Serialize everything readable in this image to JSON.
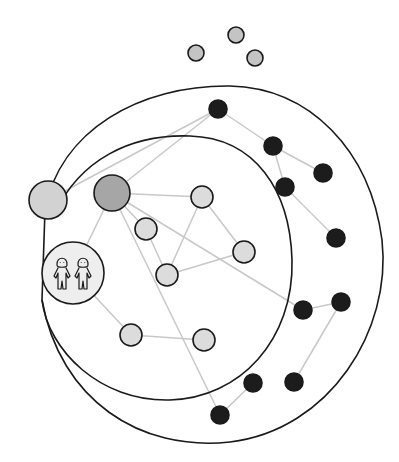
{
  "diagram": {
    "title": "",
    "colors": {
      "background": "#ffffff",
      "boundary": "#1a1a1a",
      "edge": "#c8c8c8",
      "node_stroke": "#1a1a1a",
      "outside_node": "#c4c4c4",
      "large_node": "#d2d2d2",
      "hub_node": "#a6a6a6",
      "inner_node": "#dcdcdc",
      "black_node": "#1c1c1c",
      "twins_fill": "#eeeeee"
    },
    "boundaries": [
      {
        "id": "outer-circle",
        "path": "M 45 210 C 60 130, 140 85, 230 86 C 310 88, 370 150, 382 240 C 392 330, 330 430, 230 442 C 140 452, 60 400, 42 300 Z"
      },
      {
        "id": "inner-circle",
        "path": "M 55 213 C 80 160, 130 134, 190 136 C 255 138, 290 190, 292 260 C 294 340, 240 398, 170 400 C 100 402, 48 350, 42 300"
      }
    ],
    "outside_nodes": [
      {
        "id": "o1",
        "x": 196,
        "y": 53,
        "r": 8
      },
      {
        "id": "o2",
        "x": 236,
        "y": 35,
        "r": 8
      },
      {
        "id": "o3",
        "x": 255,
        "y": 58,
        "r": 8
      }
    ],
    "special_nodes": [
      {
        "id": "large-left",
        "x": 48,
        "y": 200,
        "r": 19,
        "kind": "large"
      },
      {
        "id": "hub",
        "x": 112,
        "y": 193,
        "r": 18,
        "kind": "hub"
      }
    ],
    "inner_nodes": [
      {
        "id": "i1",
        "x": 202,
        "y": 197,
        "r": 11
      },
      {
        "id": "i2",
        "x": 146,
        "y": 229,
        "r": 11
      },
      {
        "id": "i3",
        "x": 244,
        "y": 252,
        "r": 11
      },
      {
        "id": "i4",
        "x": 167,
        "y": 275,
        "r": 11
      },
      {
        "id": "i5",
        "x": 131,
        "y": 335,
        "r": 11
      },
      {
        "id": "i6",
        "x": 204,
        "y": 340,
        "r": 11
      }
    ],
    "twins_node": {
      "id": "twins",
      "x": 73,
      "y": 273,
      "r": 31,
      "icon": "twins-icon"
    },
    "black_nodes": [
      {
        "id": "b1",
        "x": 218,
        "y": 109,
        "r": 9
      },
      {
        "id": "b2",
        "x": 273,
        "y": 146,
        "r": 9
      },
      {
        "id": "b3",
        "x": 323,
        "y": 173,
        "r": 9
      },
      {
        "id": "b4",
        "x": 285,
        "y": 187,
        "r": 9
      },
      {
        "id": "b5",
        "x": 336,
        "y": 238,
        "r": 9
      },
      {
        "id": "b6",
        "x": 303,
        "y": 310,
        "r": 9
      },
      {
        "id": "b7",
        "x": 341,
        "y": 302,
        "r": 9
      },
      {
        "id": "b8",
        "x": 294,
        "y": 382,
        "r": 9
      },
      {
        "id": "b9",
        "x": 253,
        "y": 383,
        "r": 9
      },
      {
        "id": "b10",
        "x": 220,
        "y": 415,
        "r": 9
      }
    ],
    "edges": [
      [
        "large-left",
        "b1"
      ],
      [
        "hub",
        "b1"
      ],
      [
        "hub",
        "i1"
      ],
      [
        "hub",
        "i2"
      ],
      [
        "hub",
        "twins"
      ],
      [
        "hub",
        "b6"
      ],
      [
        "hub",
        "b10"
      ],
      [
        "i2",
        "i4"
      ],
      [
        "i1",
        "i4"
      ],
      [
        "i1",
        "i3"
      ],
      [
        "i4",
        "i3"
      ],
      [
        "twins",
        "i5"
      ],
      [
        "i5",
        "i6"
      ],
      [
        "b1",
        "b2"
      ],
      [
        "b2",
        "b3"
      ],
      [
        "b2",
        "b4"
      ],
      [
        "b4",
        "b5"
      ],
      [
        "b6",
        "b7"
      ],
      [
        "b7",
        "b8"
      ],
      [
        "b9",
        "b10"
      ]
    ]
  }
}
